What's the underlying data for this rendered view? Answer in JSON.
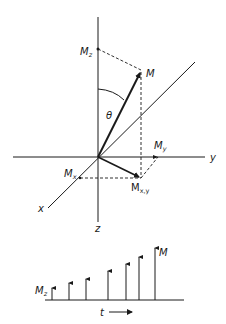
{
  "diagram": {
    "labels": {
      "Mz": {
        "main": "M",
        "sub": "z"
      },
      "M": "M",
      "theta": "θ",
      "Mx": {
        "main": "M",
        "sub": "x"
      },
      "My": {
        "main": "M",
        "sub": "y"
      },
      "Mxy": {
        "main": "M",
        "sub": "x,y"
      },
      "axis_x": "x",
      "axis_y": "y",
      "axis_z": "z"
    },
    "bottom": {
      "label_Mz": {
        "main": "M",
        "sub": "z"
      },
      "label_M": "M",
      "label_t": "t",
      "arrow_x": [
        52,
        69,
        86,
        108,
        126,
        139,
        155
      ],
      "arrow_top": [
        288,
        283,
        279,
        271,
        264,
        257,
        248
      ],
      "baseline_y": 300
    }
  }
}
